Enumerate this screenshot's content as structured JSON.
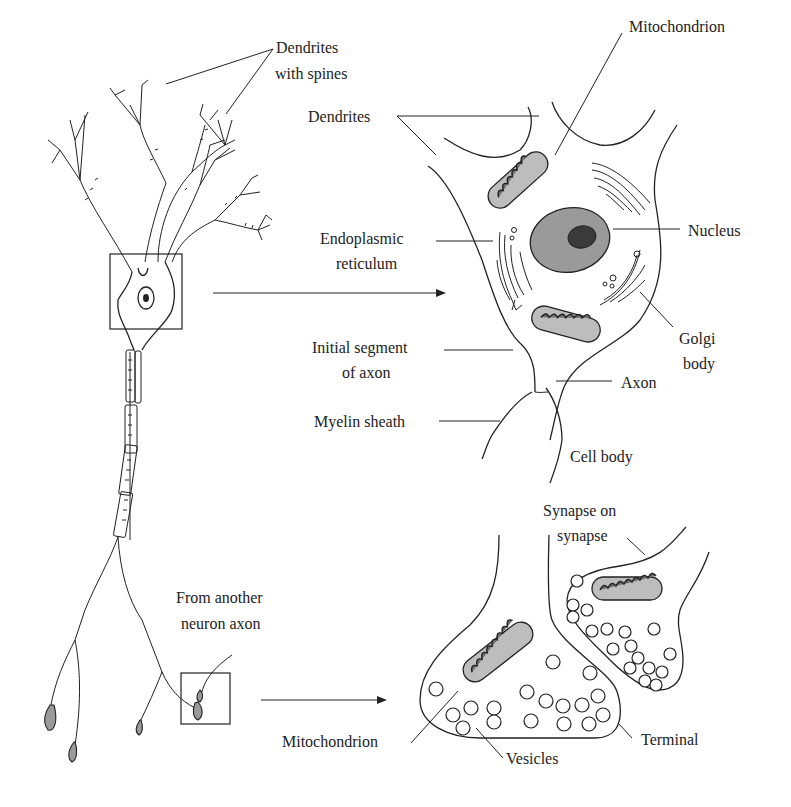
{
  "diagram": {
    "type": "neuron-anatomy",
    "colors": {
      "line": "#222222",
      "background": "#ffffff",
      "nucleus": "#8a8a8a",
      "nucleolus": "#3a3a3a",
      "mitochondrion_fill": "#bdbdbd",
      "terminal_bouton": "#9a9a9a"
    },
    "panels": {
      "whole_neuron": {
        "labels": {
          "dendrites_with_spines_line1": "Dendrites",
          "dendrites_with_spines_line2": "with spines",
          "from_another_line1": "From another",
          "from_another_line2": "neuron axon"
        }
      },
      "cell_body": {
        "labels": {
          "mitochondrion": "Mitochondrion",
          "dendrites": "Dendrites",
          "nucleus": "Nucleus",
          "er_line1": "Endoplasmic",
          "er_line2": "reticulum",
          "golgi_line1": "Golgi",
          "golgi_line2": "body",
          "initial_segment_line1": "Initial segment",
          "initial_segment_line2": "of axon",
          "axon": "Axon",
          "myelin_sheath": "Myelin sheath",
          "cell_body": "Cell body"
        }
      },
      "synapse": {
        "labels": {
          "synapse_on_line1": "Synapse on",
          "synapse_on_line2": "synapse",
          "mitochondrion": "Mitochondrion",
          "vesicles": "Vesicles",
          "terminal": "Terminal"
        }
      }
    }
  }
}
